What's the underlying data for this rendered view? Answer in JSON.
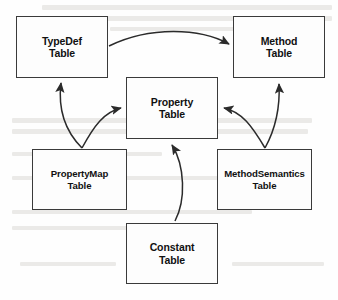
{
  "diagram": {
    "background_color": "#fefefe",
    "box_border_color": "#3a3a3a",
    "arrow_color": "#2b2b2b",
    "nodes": [
      {
        "id": "typedef",
        "name": "TypeDef Table",
        "line1": "TypeDef",
        "line2": "Table",
        "x": 16,
        "y": 16,
        "w": 92,
        "h": 62
      },
      {
        "id": "method",
        "name": "Method Table",
        "line1": "Method",
        "line2": "Table",
        "x": 233,
        "y": 16,
        "w": 92,
        "h": 62
      },
      {
        "id": "property",
        "name": "Property Table",
        "line1": "Property",
        "line2": "Table",
        "x": 126,
        "y": 77,
        "w": 92,
        "h": 62
      },
      {
        "id": "propertymap",
        "name": "PropertyMap Table",
        "line1": "PropertyMap",
        "line2": "Table",
        "x": 32,
        "y": 149,
        "w": 95,
        "h": 61
      },
      {
        "id": "methodsemantics",
        "name": "MethodSemantics Table",
        "line1": "MethodSemantics",
        "line2": "Table",
        "x": 217,
        "y": 149,
        "w": 95,
        "h": 61
      },
      {
        "id": "constant",
        "name": "Constant Table",
        "line1": "Constant",
        "line2": "Table",
        "x": 126,
        "y": 223,
        "w": 92,
        "h": 61
      }
    ],
    "edges": [
      {
        "id": "typedef-to-method",
        "from": "typedef",
        "to": "method",
        "label": "",
        "path": "M 109 46 C 150 26, 200 28, 229 44"
      },
      {
        "id": "propertymap-to-typedef",
        "from": "propertymap",
        "to": "typedef",
        "label": "",
        "path": "M 82 148 C 64 130, 58 108, 61 83"
      },
      {
        "id": "propertymap-to-property",
        "from": "propertymap",
        "to": "property",
        "label": "",
        "path": "M 82 148 C 94 126, 104 112, 121 108"
      },
      {
        "id": "methodsemantics-to-property",
        "from": "methodsemantics",
        "to": "property",
        "label": "",
        "path": "M 265 148 C 252 126, 242 112, 224 108"
      },
      {
        "id": "methodsemantics-to-method",
        "from": "methodsemantics",
        "to": "method",
        "label": "",
        "path": "M 265 148 C 276 128, 280 104, 279 84"
      },
      {
        "id": "constant-to-property",
        "from": "constant",
        "to": "property",
        "label": "",
        "path": "M 175 221 C 186 200, 185 166, 172 145"
      }
    ]
  }
}
